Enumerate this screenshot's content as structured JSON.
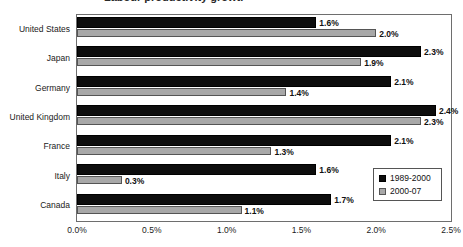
{
  "chart_data": {
    "type": "bar",
    "orientation": "horizontal",
    "title": "",
    "xlabel": "",
    "ylabel": "",
    "xlim": [
      0,
      2.5
    ],
    "xticks": [
      "0.0%",
      "0.5%",
      "1.0%",
      "1.5%",
      "2.0%",
      "2.5%"
    ],
    "xtick_values": [
      0.0,
      0.5,
      1.0,
      1.5,
      2.0,
      2.5
    ],
    "grid": false,
    "legend_position": "bottom-right",
    "categories": [
      "United States",
      "Japan",
      "Germany",
      "United Kingdom",
      "France",
      "Italy",
      "Canada"
    ],
    "series": [
      {
        "name": "1989-2000",
        "color": "#0d0d0d",
        "values": [
          1.6,
          2.3,
          2.1,
          2.4,
          2.1,
          1.6,
          1.7
        ],
        "labels": [
          "1.6%",
          "2.3%",
          "2.1%",
          "2.4%",
          "2.1%",
          "1.6%",
          "1.7%"
        ]
      },
      {
        "name": "2000-07",
        "color": "#a8a8a8",
        "values": [
          2.0,
          1.9,
          1.4,
          2.3,
          1.3,
          0.3,
          1.1
        ],
        "labels": [
          "2.0%",
          "1.9%",
          "1.4%",
          "2.3%",
          "1.3%",
          "0.3%",
          "1.1%"
        ]
      }
    ]
  },
  "legend": {
    "entries": [
      {
        "label": "1989-2000"
      },
      {
        "label": "2000-07"
      }
    ]
  },
  "title_fragment": "Labour productivity growth"
}
